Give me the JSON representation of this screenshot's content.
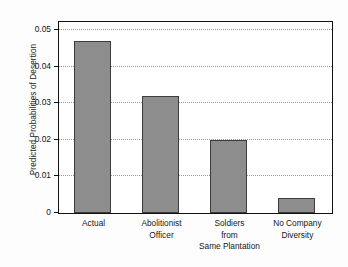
{
  "chart_data": {
    "type": "bar",
    "title": "",
    "xlabel": "",
    "ylabel": "Predicted Probabilities of Desertion",
    "categories": [
      "Actual",
      "Abolitionist\nOfficer",
      "Soldiers\nfrom\nSame Plantation",
      "No Company\nDiversity"
    ],
    "values": [
      0.047,
      0.032,
      0.02,
      0.004
    ],
    "ylim": [
      0,
      0.052
    ],
    "yticks": [
      0,
      0.01,
      0.02,
      0.03,
      0.04,
      0.05
    ],
    "ytick_labels": [
      "0",
      "0.01",
      "0.02",
      "0.03",
      "0.04",
      "0.05"
    ],
    "grid": true,
    "legend": "none",
    "bar_color": "#8d8d8d",
    "bar_edge_color": "#3c3c3c",
    "frame_color": "#111111",
    "grid_color": "#9a9a9a"
  }
}
